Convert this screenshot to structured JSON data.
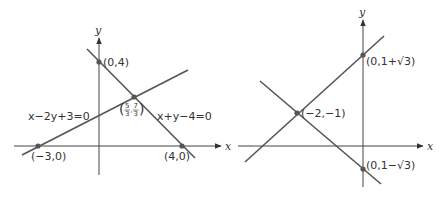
{
  "colors": {
    "line": "#555555",
    "axis": "#444444",
    "point": "#555555",
    "text": "#333333"
  },
  "left_diagram": {
    "axes": {
      "x_label": "x",
      "y_label": "y"
    },
    "lines": [
      {
        "equation": "x+y−4=0"
      },
      {
        "equation": "x−2y+3=0"
      }
    ],
    "points": {
      "p1": "(0,4)",
      "p2_open": "(",
      "p2_num1": "5",
      "p2_den1": "3",
      "p2_sep": ",",
      "p2_num2": "7",
      "p2_den2": "3",
      "p2_close": ")",
      "p3": "(−3,0)",
      "p4": "(4,0)"
    }
  },
  "right_diagram": {
    "axes": {
      "x_label": "x",
      "y_label": "y",
      "x_label_left": "x"
    },
    "points": {
      "p1": "(0,1+√3)",
      "p2": "(−2,−1)",
      "p3": "(0,1−√3)"
    }
  }
}
